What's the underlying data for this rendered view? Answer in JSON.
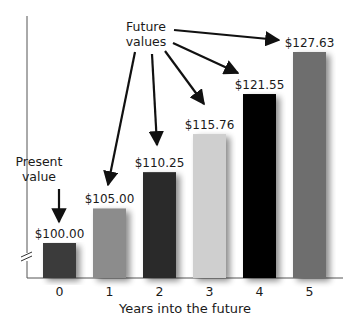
{
  "chart_data": {
    "type": "bar",
    "title": "",
    "xlabel": "Years into the future",
    "ylabel": "",
    "categories": [
      "0",
      "1",
      "2",
      "3",
      "4",
      "5"
    ],
    "values": [
      100.0,
      105.0,
      110.25,
      115.76,
      121.55,
      127.63
    ],
    "value_labels": [
      "$100.00",
      "$105.00",
      "$110.25",
      "$115.76",
      "$121.55",
      "$127.63"
    ],
    "bar_colors": [
      "#3a3a3a",
      "#8c8c8c",
      "#2b2b2b",
      "#cfcfcf",
      "#050505",
      "#6e6e6e"
    ],
    "ylim": [
      80,
      130
    ],
    "axis_break": true,
    "grid": false,
    "legend": null,
    "annotations": [
      {
        "text": [
          "Present",
          "value"
        ],
        "points_to": [
          "0"
        ]
      },
      {
        "text": [
          "Future",
          "values"
        ],
        "points_to": [
          "1",
          "2",
          "3",
          "4",
          "5"
        ]
      }
    ]
  }
}
